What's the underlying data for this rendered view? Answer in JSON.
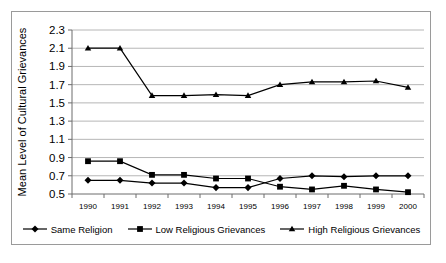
{
  "chart_data": {
    "type": "line",
    "title": "",
    "xlabel": "",
    "ylabel": "Mean Level of Cultural Grievances",
    "categories": [
      "1990",
      "1991",
      "1992",
      "1993",
      "1994",
      "1995",
      "1996",
      "1997",
      "1998",
      "1999",
      "2000"
    ],
    "x": [
      1990,
      1991,
      1992,
      1993,
      1994,
      1995,
      1996,
      1997,
      1998,
      1999,
      2000
    ],
    "ylim": [
      0.5,
      2.3
    ],
    "yticks": [
      "0.5",
      "0.7",
      "0.9",
      "1.1",
      "1.3",
      "1.5",
      "1.7",
      "1.9",
      "2.1",
      "2.3"
    ],
    "ytick_values": [
      0.5,
      0.7,
      0.9,
      1.1,
      1.3,
      1.5,
      1.7,
      1.9,
      2.1,
      2.3
    ],
    "grid": true,
    "legend_position": "bottom",
    "series": [
      {
        "name": "Same Religion",
        "marker": "diamond",
        "values": [
          0.65,
          0.65,
          0.62,
          0.62,
          0.57,
          0.57,
          0.67,
          0.7,
          0.69,
          0.7,
          0.7
        ]
      },
      {
        "name": "Low Religious Grievances",
        "marker": "square",
        "values": [
          0.86,
          0.86,
          0.71,
          0.71,
          0.67,
          0.67,
          0.58,
          0.55,
          0.59,
          0.55,
          0.52
        ]
      },
      {
        "name": "High Religious Grievances",
        "marker": "triangle",
        "values": [
          2.1,
          2.1,
          1.58,
          1.58,
          1.59,
          1.58,
          1.7,
          1.73,
          1.73,
          1.74,
          1.67
        ]
      }
    ]
  },
  "colors": {
    "series": "#000000",
    "grid": "#b6b6b6",
    "axis": "#6d6d6d",
    "border": "#9a9a9a",
    "background": "#ffffff"
  },
  "legend": {
    "items": [
      {
        "label": "Same Religion",
        "marker": "diamond"
      },
      {
        "label": "Low Religious Grievances",
        "marker": "square"
      },
      {
        "label": "High Religious Grievances",
        "marker": "triangle"
      }
    ]
  }
}
